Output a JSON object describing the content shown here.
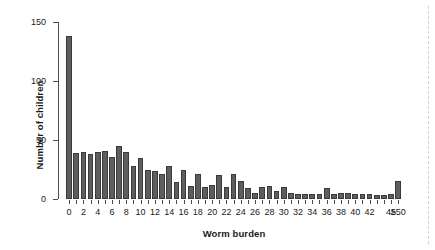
{
  "chart_data": {
    "type": "bar",
    "title": "",
    "xlabel": "Worm burden",
    "ylabel": "Number of children",
    "ylim": [
      0,
      150
    ],
    "yticks": [
      0,
      50,
      100,
      150
    ],
    "ytick_labels": [
      "0",
      "50",
      "100",
      "150"
    ],
    "grid": false,
    "legend": null,
    "categories": [
      "0",
      "1",
      "2",
      "3",
      "4",
      "5",
      "6",
      "7",
      "8",
      "9",
      "10",
      "11",
      "12",
      "13",
      "14",
      "15",
      "16",
      "17",
      "18",
      "19",
      "20",
      "21",
      "22",
      "23",
      "24",
      "25",
      "26",
      "27",
      "28",
      "29",
      "30",
      "31",
      "32",
      "33",
      "34",
      "35",
      "36",
      "37",
      "38",
      "39",
      "40",
      "41",
      "42",
      "43",
      "44",
      "45",
      "≥50"
    ],
    "xtick_labels": [
      "0",
      "",
      "2",
      "",
      "4",
      "",
      "6",
      "",
      "8",
      "",
      "10",
      "",
      "12",
      "",
      "14",
      "",
      "16",
      "",
      "18",
      "",
      "20",
      "",
      "22",
      "",
      "24",
      "",
      "26",
      "",
      "28",
      "",
      "30",
      "",
      "32",
      "",
      "34",
      "",
      "36",
      "",
      "38",
      "",
      "40",
      "",
      "42",
      "",
      "",
      "45",
      "≥50"
    ],
    "values": [
      138,
      39,
      40,
      38,
      40,
      41,
      36,
      45,
      40,
      28,
      35,
      25,
      24,
      21,
      28,
      14,
      25,
      11,
      21,
      10,
      12,
      20,
      10,
      21,
      15,
      9,
      5,
      10,
      11,
      7,
      10,
      5,
      4,
      4,
      4,
      4,
      9,
      4,
      5,
      5,
      4,
      4,
      4,
      3,
      3,
      4,
      15
    ],
    "bar_color": "#5e5e5e",
    "bar_edge_color": "#3a3a3a"
  }
}
